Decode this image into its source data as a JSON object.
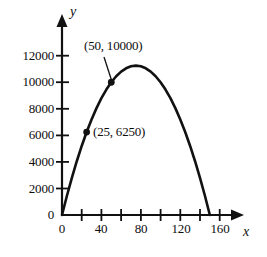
{
  "chart_data": {
    "type": "line",
    "title": "",
    "xlabel": "x",
    "ylabel": "y",
    "xlim": [
      0,
      175
    ],
    "ylim": [
      0,
      13000
    ],
    "grid": false,
    "legend": null,
    "curve_equation": "y = 300x - 2x^2",
    "x_ticks": [
      0,
      20,
      40,
      60,
      80,
      100,
      120,
      140,
      160
    ],
    "x_tick_labels": [
      "0",
      "",
      "40",
      "",
      "80",
      "",
      "120",
      "",
      "160"
    ],
    "y_ticks": [
      0,
      2000,
      4000,
      6000,
      8000,
      10000,
      12000
    ],
    "y_tick_labels": [
      "0",
      "2000",
      "4000",
      "6000",
      "8000",
      "10000",
      "12000"
    ],
    "roots": [
      0,
      150
    ],
    "vertex": [
      75,
      11250
    ],
    "points": [
      {
        "x": 25,
        "y": 6250,
        "label": "(25, 6250)",
        "marker": "dot"
      },
      {
        "x": 50,
        "y": 10000,
        "label": "(50, 10000)",
        "marker": "dot"
      }
    ],
    "series": [
      {
        "name": "parabola",
        "color": "#111111",
        "x": [
          0,
          5,
          10,
          15,
          20,
          25,
          30,
          35,
          40,
          45,
          50,
          55,
          60,
          65,
          70,
          75,
          80,
          85,
          90,
          95,
          100,
          105,
          110,
          115,
          120,
          125,
          130,
          135,
          140,
          145,
          150
        ],
        "values": [
          0,
          1450,
          2800,
          4050,
          5200,
          6250,
          7200,
          8050,
          8800,
          9450,
          10000,
          10450,
          10800,
          11050,
          11200,
          11250,
          11200,
          11050,
          10800,
          10450,
          10000,
          9450,
          8800,
          8050,
          7200,
          6250,
          5200,
          4050,
          2800,
          1450,
          0
        ]
      }
    ]
  },
  "axes": {
    "y_axis_name": "y",
    "x_axis_name": "x",
    "origin_label": "0"
  },
  "annotations": {
    "upper": "(50, 10000)",
    "lower": "(25, 6250)"
  },
  "colors": {
    "curve": "#111111",
    "axis": "#111111",
    "text": "#0d0d0d",
    "background": "#ffffff"
  }
}
